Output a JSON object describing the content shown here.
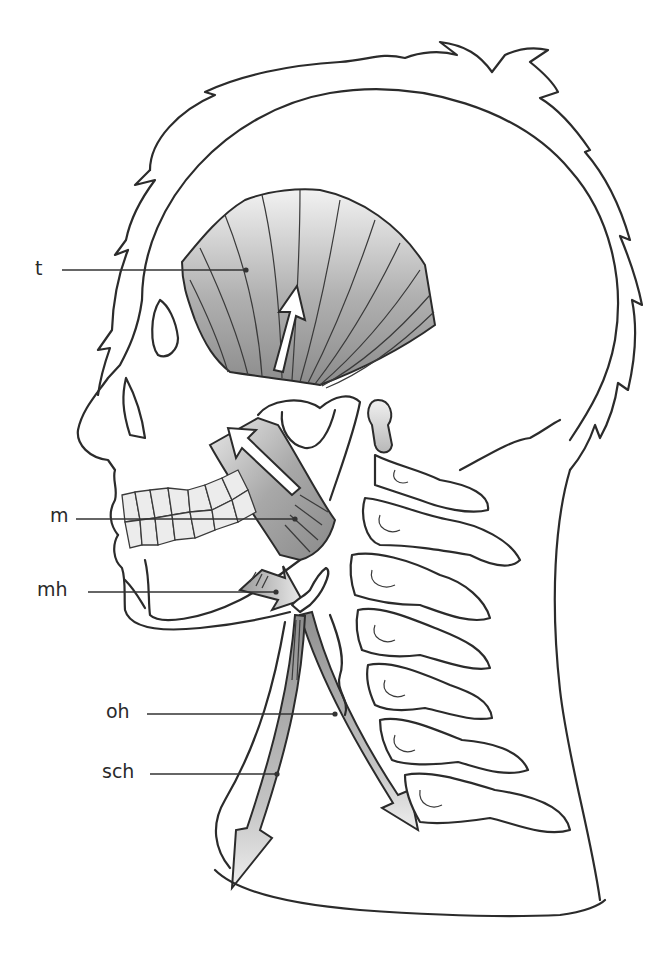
{
  "figure": {
    "colors": {
      "outline": "#2b2b2b",
      "muscle_dark": "#8f8f8f",
      "muscle_light": "#e6e6e6",
      "arrow_fill": "#ffffff",
      "background": "#ffffff"
    }
  },
  "labels": [
    {
      "id": "t",
      "text": "t",
      "x": 35,
      "y": 260,
      "target": [
        246,
        270
      ]
    },
    {
      "id": "m",
      "text": "m",
      "x": 50,
      "y": 510,
      "target": [
        295,
        519
      ]
    },
    {
      "id": "mh",
      "text": "mh",
      "x": 37,
      "y": 581,
      "target": [
        276,
        592
      ]
    },
    {
      "id": "oh",
      "text": "oh",
      "x": 106,
      "y": 703,
      "target": [
        335,
        714
      ]
    },
    {
      "id": "sch",
      "text": "sch",
      "x": 102,
      "y": 764,
      "target": [
        277,
        774
      ]
    }
  ]
}
